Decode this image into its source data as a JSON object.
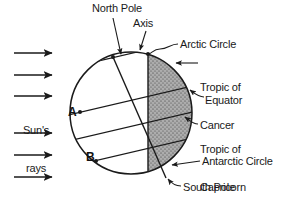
{
  "diagram": {
    "canvas": {
      "width": 302,
      "height": 207
    },
    "colors": {
      "stroke": "#1a1a1a",
      "shaded_hemisphere": "#a9a9a9",
      "background": "#ffffff",
      "text": "#1a1a1a"
    },
    "globe": {
      "center_x": 131,
      "center_y": 113,
      "radius": 61,
      "terminator_x": 148,
      "shaded_side": "right"
    }
  },
  "labels": {
    "north_pole": "North Pole",
    "axis": "Axis",
    "arctic_circle": "Arctic Circle",
    "tropic_of_cancer": "Tropic of\nCancer",
    "tropic_of_cancer_line1": "Tropic of",
    "tropic_of_cancer_line2": "Cancer",
    "equator": "Equator",
    "tropic_of_capricorn_line1": "Tropic of",
    "tropic_of_capricorn_line2": "Capricorn",
    "antarctic_circle": "Antarctic Circle",
    "south_pole": "South Pole",
    "suns_rays_line1": "Sun's",
    "suns_rays_line2": "rays",
    "point_a": "A",
    "point_b": "B"
  },
  "sun_rays": {
    "count": 6,
    "direction": "left-to-right",
    "x_start": 14,
    "x_end": 54,
    "y_positions": [
      53,
      75,
      96,
      133,
      155,
      177
    ]
  },
  "latitude_lines": [
    {
      "name": "arctic-circle",
      "label": "Arctic Circle",
      "left_x": 97,
      "left_y": 62,
      "right_x": 300,
      "right_y": 45
    },
    {
      "name": "tropic-of-cancer",
      "label": "Tropic of Cancer",
      "left_x": 80,
      "left_y": 112,
      "right_x": 300,
      "right_y": 62
    },
    {
      "name": "equator",
      "label": "Equator",
      "left_x": 75,
      "left_y": 138,
      "right_x": 300,
      "right_y": 98
    },
    {
      "name": "tropic-of-capricorn",
      "label": "Tropic of Capricorn",
      "left_x": 96,
      "left_y": 161,
      "right_x": 300,
      "right_y": 122
    },
    {
      "name": "antarctic-circle",
      "label": "Antarctic Circle",
      "left_x": 120,
      "left_y": 177,
      "right_x": 300,
      "right_y": 158
    }
  ],
  "points": [
    {
      "name": "point-a",
      "label": "A",
      "x": 80,
      "y": 112
    },
    {
      "name": "point-b",
      "label": "B",
      "x": 96,
      "y": 161
    }
  ]
}
